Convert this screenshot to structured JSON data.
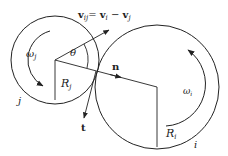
{
  "diagram": {
    "labels": {
      "relative_velocity": "v",
      "relative_velocity_sub": "ij",
      "relative_velocity_eq": "= ",
      "vi": "v",
      "vi_sub": "i",
      "minus": " − ",
      "vj": "v",
      "vj_sub": "j",
      "theta": "θ",
      "normal": "n",
      "tangent": "t",
      "omega_j": "ω",
      "omega_j_sub": "j",
      "omega_i": "ω",
      "omega_i_sub": "i",
      "radius_j": "R",
      "radius_j_sub": "j",
      "radius_i": "R",
      "radius_i_sub": "i",
      "particle_j": "j",
      "particle_i": "i"
    },
    "nodes": [
      {
        "id": "particle-j",
        "shape": "circle",
        "label": "j",
        "radius_label": "R_j",
        "angular_velocity": "ω_j"
      },
      {
        "id": "particle-i",
        "shape": "circle",
        "label": "i",
        "radius_label": "R_i",
        "angular_velocity": "ω_i"
      }
    ],
    "edges": [
      {
        "from": "center-j",
        "to": "center-i",
        "label": "n",
        "kind": "normal-vector"
      },
      {
        "from": "contact-point",
        "to": "down",
        "label": "t",
        "kind": "tangent-vector"
      },
      {
        "from": "center-j",
        "to": "up-right",
        "label": "v_ij = v_i − v_j",
        "kind": "relative-velocity"
      }
    ],
    "colors": {
      "stroke": "#222222",
      "background": "#ffffff"
    }
  }
}
